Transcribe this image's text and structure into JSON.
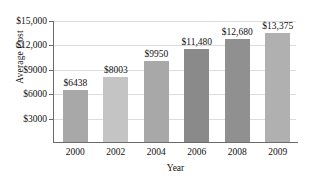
{
  "chart_data": {
    "type": "bar",
    "title": "",
    "xlabel": "Year",
    "ylabel": "Average Cost",
    "categories": [
      "2000",
      "2002",
      "2004",
      "2006",
      "2008",
      "2009"
    ],
    "values": [
      6438,
      8003,
      9950,
      11480,
      12680,
      13375
    ],
    "value_labels": [
      "$6438",
      "$8003",
      "$9950",
      "$11,480",
      "$12,680",
      "$13,375"
    ],
    "ylim": [
      0,
      15000
    ],
    "yticks": [
      3000,
      6000,
      9000,
      12000,
      15000
    ],
    "ytick_labels": [
      "$3000",
      "$6000",
      "$9000",
      "$12,000",
      "$15,000"
    ],
    "grid": "horizontal",
    "legend": "none",
    "bar_colors": [
      "#a8a8a8",
      "#c4c4c4",
      "#a8a8a8",
      "#8a8a8a",
      "#909090",
      "#b0b0b0"
    ],
    "axis_color": "#6b6b6b",
    "grid_color": "#dcdcdc",
    "text_color": "#111111",
    "background": "#ffffff"
  }
}
